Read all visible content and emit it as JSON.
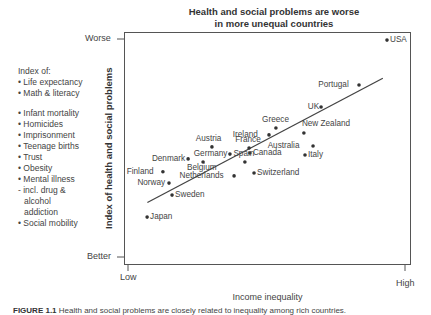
{
  "chart_data": {
    "type": "scatter",
    "title_lines": [
      "Health and social problems are worse",
      "in more unequal countries"
    ],
    "xlabel": "Income inequality",
    "ylabel": "Index of health and social problems",
    "x_tick_labels": [
      "Low",
      "High"
    ],
    "y_tick_labels": [
      "Better",
      "Worse"
    ],
    "xlim": [
      0,
      1
    ],
    "ylim": [
      0,
      1
    ],
    "grid": false,
    "trendline": {
      "x": [
        0.07,
        0.92
      ],
      "y": [
        0.25,
        0.82
      ]
    },
    "points": [
      {
        "label": "USA",
        "x": 0.935,
        "y": 0.995
      },
      {
        "label": "Portugal",
        "x": 0.834,
        "y": 0.789
      },
      {
        "label": "UK",
        "x": 0.697,
        "y": 0.688
      },
      {
        "label": "New Zealand",
        "x": 0.635,
        "y": 0.569
      },
      {
        "label": "Greece",
        "x": 0.534,
        "y": 0.592
      },
      {
        "label": "Ireland",
        "x": 0.509,
        "y": 0.56
      },
      {
        "label": "France",
        "x": 0.437,
        "y": 0.5
      },
      {
        "label": "Canada",
        "x": 0.44,
        "y": 0.477
      },
      {
        "label": "Australia",
        "x": 0.668,
        "y": 0.509
      },
      {
        "label": "Italy",
        "x": 0.639,
        "y": 0.468
      },
      {
        "label": "Spain",
        "x": 0.422,
        "y": 0.436
      },
      {
        "label": "Switzerland",
        "x": 0.455,
        "y": 0.385
      },
      {
        "label": "Netherlands",
        "x": 0.383,
        "y": 0.372
      },
      {
        "label": "Austria",
        "x": 0.303,
        "y": 0.505
      },
      {
        "label": "Germany",
        "x": 0.368,
        "y": 0.472
      },
      {
        "label": "Denmark",
        "x": 0.217,
        "y": 0.45
      },
      {
        "label": "Belgium",
        "x": 0.271,
        "y": 0.436
      },
      {
        "label": "Finland",
        "x": 0.126,
        "y": 0.391
      },
      {
        "label": "Norway",
        "x": 0.148,
        "y": 0.339
      },
      {
        "label": "Sweden",
        "x": 0.159,
        "y": 0.284
      },
      {
        "label": "Japan",
        "x": 0.069,
        "y": 0.183
      }
    ]
  },
  "index_legend": {
    "heading": "Index of:",
    "group1": [
      "• Life expectancy",
      "• Math & literacy"
    ],
    "group2": [
      "• Infant mortality",
      "• Homicides",
      "• Imprisonment",
      "• Teenage births",
      "• Trust",
      "• Obesity",
      "• Mental illness",
      "- incl. drug &",
      "  alcohol",
      "  addiction",
      "• Social mobility"
    ]
  },
  "caption": {
    "label": "FIGURE 1.1",
    "text": "Health and social problems are closely related to inequality among rich countries."
  },
  "colors": {
    "ink": "#333333",
    "line": "#555555",
    "background": "#ffffff"
  }
}
